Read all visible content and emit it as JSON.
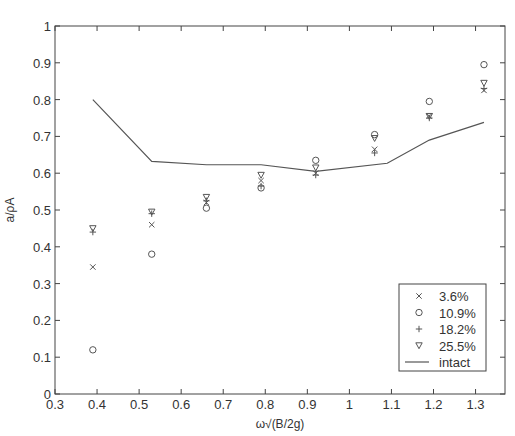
{
  "chart_data": {
    "type": "scatter",
    "title": "",
    "xlabel": "ω√(B/2g)",
    "ylabel": "a/ρA",
    "xlim": [
      0.3,
      1.37
    ],
    "ylim": [
      0,
      1
    ],
    "x_ticks": [
      0.3,
      0.4,
      0.5,
      0.6,
      0.7,
      0.8,
      0.9,
      1,
      1.1,
      1.2,
      1.3
    ],
    "x_tick_labels": [
      "0.3",
      "0.4",
      "0.5",
      "0.6",
      "0.7",
      "0.8",
      "0.9",
      "1",
      "1.1",
      "1.2",
      "1.3"
    ],
    "y_ticks": [
      0,
      0.1,
      0.2,
      0.3,
      0.4,
      0.5,
      0.6,
      0.7,
      0.8,
      0.9,
      1
    ],
    "y_tick_labels": [
      "0",
      "0.1",
      "0.2",
      "0.3",
      "0.4",
      "0.5",
      "0.6",
      "0.7",
      "0.8",
      "0.9",
      "1"
    ],
    "grid": false,
    "legend_position": "lower right",
    "x": [
      0.39,
      0.53,
      0.66,
      0.79,
      0.92,
      1.06,
      1.19,
      1.32
    ],
    "series": [
      {
        "name": "3.6%",
        "marker": "x",
        "style": "markers",
        "values": [
          0.345,
          0.46,
          0.52,
          0.58,
          0.6,
          0.665,
          0.755,
          0.825
        ]
      },
      {
        "name": "10.9%",
        "marker": "circle",
        "style": "markers",
        "values": [
          0.12,
          0.38,
          0.505,
          0.56,
          0.635,
          0.705,
          0.795,
          0.895
        ]
      },
      {
        "name": "18.2%",
        "marker": "plus",
        "style": "markers",
        "values": [
          0.44,
          0.49,
          0.525,
          0.565,
          0.595,
          0.655,
          0.75,
          0.83
        ]
      },
      {
        "name": "25.5%",
        "marker": "triangle",
        "style": "markers",
        "values": [
          0.45,
          0.495,
          0.535,
          0.595,
          0.615,
          0.695,
          0.755,
          0.845
        ]
      },
      {
        "name": "intact",
        "marker": "none",
        "style": "line",
        "x": [
          0.39,
          0.53,
          0.66,
          0.79,
          0.92,
          1.09,
          1.19,
          1.32
        ],
        "values": [
          0.8,
          0.632,
          0.623,
          0.623,
          0.605,
          0.627,
          0.69,
          0.738
        ]
      }
    ]
  },
  "colors": {
    "axis": "#444444",
    "series": "#555555",
    "background": "#ffffff"
  }
}
